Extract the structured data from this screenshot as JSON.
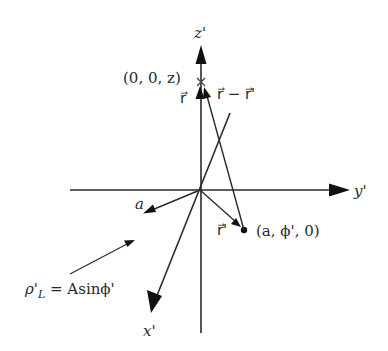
{
  "diagram": {
    "type": "3d-coordinate-geometry",
    "axes": {
      "z": {
        "label": "z'"
      },
      "y": {
        "label": "y'"
      },
      "x": {
        "label": "x'"
      }
    },
    "points": {
      "field_point": {
        "label": "(0, 0, z)",
        "marker": "x-mark"
      },
      "source_point": {
        "label": "(a, ϕ', 0)",
        "marker": "dot"
      }
    },
    "vectors": {
      "r": {
        "label": "r⃗"
      },
      "r_minus_r_prime": {
        "label": "r⃗ − r⃗'"
      },
      "r_prime": {
        "label": "r⃗'"
      },
      "radius": {
        "label": "a"
      }
    },
    "annotation": {
      "rho": "ρ'",
      "subscript": "L",
      "equals": " = Asinϕ'"
    },
    "colors": {
      "line": "#2a2a2a",
      "background": "#ffffff"
    }
  }
}
